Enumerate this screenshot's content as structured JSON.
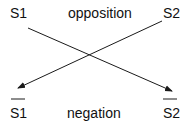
{
  "diagram": {
    "top_left": "S1",
    "top_right": "S2",
    "top_relation": "opposition",
    "bottom_left": "S1",
    "bottom_right": "S2",
    "bottom_relation": "negation",
    "bottom_overbar": true,
    "arrows": [
      {
        "from": "S1 (top-left)",
        "to": "S2 negated (bottom-right)"
      },
      {
        "from": "S2 (top-right)",
        "to": "S1 negated (bottom-left)"
      }
    ],
    "line_color": "#1a1a1a"
  }
}
